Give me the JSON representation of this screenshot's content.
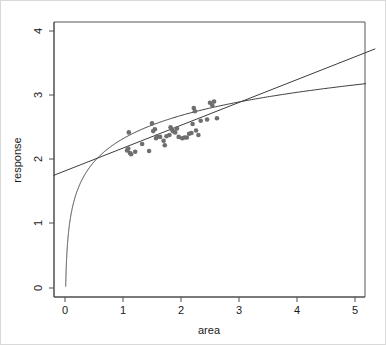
{
  "chart_data": {
    "type": "scatter",
    "title": "",
    "xlabel": "area",
    "ylabel": "response",
    "xlim": [
      -0.2,
      5.35
    ],
    "ylim": [
      -0.15,
      4.2
    ],
    "xticks": [
      0,
      1,
      2,
      3,
      4,
      5
    ],
    "yticks": [
      0,
      1,
      2,
      3,
      4
    ],
    "xtick_labels": [
      "0",
      "1",
      "2",
      "3",
      "4",
      "5"
    ],
    "ytick_labels": [
      "0",
      "1",
      "2",
      "3",
      "4"
    ],
    "grid": false,
    "legend": null,
    "point_color": "#6e6e6e",
    "line_color": "#3c3c3c",
    "axis_color": "#4d4d4d",
    "background": "#ffffff",
    "border_color": "#c8c8c8",
    "points": [
      {
        "x": 1.07,
        "y": 2.14
      },
      {
        "x": 1.09,
        "y": 2.17
      },
      {
        "x": 1.1,
        "y": 2.42
      },
      {
        "x": 1.12,
        "y": 2.1
      },
      {
        "x": 1.14,
        "y": 2.08
      },
      {
        "x": 1.21,
        "y": 2.12
      },
      {
        "x": 1.45,
        "y": 2.13
      },
      {
        "x": 1.5,
        "y": 2.56
      },
      {
        "x": 1.52,
        "y": 2.44
      },
      {
        "x": 1.55,
        "y": 2.47
      },
      {
        "x": 1.57,
        "y": 2.33
      },
      {
        "x": 1.59,
        "y": 2.36
      },
      {
        "x": 1.64,
        "y": 2.35
      },
      {
        "x": 1.7,
        "y": 2.29
      },
      {
        "x": 1.72,
        "y": 2.22
      },
      {
        "x": 1.75,
        "y": 2.36
      },
      {
        "x": 1.8,
        "y": 2.38
      },
      {
        "x": 1.82,
        "y": 2.5
      },
      {
        "x": 1.84,
        "y": 2.47
      },
      {
        "x": 1.86,
        "y": 2.44
      },
      {
        "x": 1.9,
        "y": 2.42
      },
      {
        "x": 1.96,
        "y": 2.35
      },
      {
        "x": 2.02,
        "y": 2.33
      },
      {
        "x": 2.06,
        "y": 2.34
      },
      {
        "x": 2.1,
        "y": 2.34
      },
      {
        "x": 2.14,
        "y": 2.4
      },
      {
        "x": 2.18,
        "y": 2.41
      },
      {
        "x": 2.2,
        "y": 2.55
      },
      {
        "x": 2.22,
        "y": 2.8
      },
      {
        "x": 2.24,
        "y": 2.75
      },
      {
        "x": 2.26,
        "y": 2.45
      },
      {
        "x": 2.3,
        "y": 2.38
      },
      {
        "x": 2.34,
        "y": 2.6
      },
      {
        "x": 2.45,
        "y": 2.62
      },
      {
        "x": 2.5,
        "y": 2.88
      },
      {
        "x": 2.54,
        "y": 2.84
      },
      {
        "x": 2.57,
        "y": 2.9
      },
      {
        "x": 2.62,
        "y": 2.64
      },
      {
        "x": 1.33,
        "y": 2.24
      },
      {
        "x": 1.93,
        "y": 2.48
      }
    ],
    "series": [
      {
        "name": "linear-fit",
        "type": "line",
        "endpoints": [
          {
            "x": -0.2,
            "y": 1.75
          },
          {
            "x": 5.35,
            "y": 3.72
          }
        ],
        "slope": 0.355,
        "intercept": 1.821
      },
      {
        "name": "log-fit",
        "type": "curve",
        "formula": "a + b*log(x)",
        "a": 2.322,
        "b": 0.52,
        "x_start": 0.012,
        "x_end": 5.35,
        "y_at_x_start": 0.0,
        "y_at_5": 3.17
      }
    ]
  }
}
